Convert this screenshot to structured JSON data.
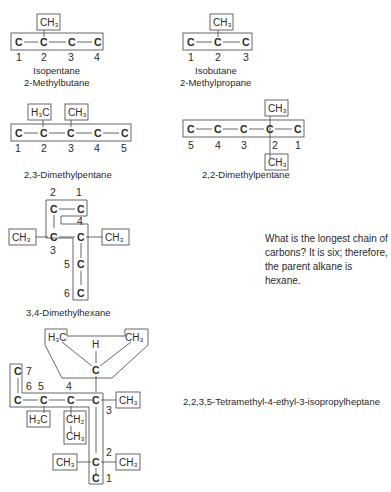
{
  "figure": {
    "isopentane": {
      "common_name": "Isopentane",
      "iupac_name": "2-Methylbutane",
      "atoms": [
        "C",
        "C",
        "C",
        "C"
      ],
      "numbers": [
        "1",
        "2",
        "3",
        "4"
      ],
      "substituent": "CH3"
    },
    "isobutane": {
      "common_name": "Isobutane",
      "iupac_name": "2-Methylpropane",
      "atoms": [
        "C",
        "C",
        "C"
      ],
      "numbers": [
        "1",
        "2",
        "3"
      ],
      "substituent": "CH3"
    },
    "dimethylpentane_23": {
      "iupac_name": "2,3-Dimethylpentane",
      "atoms": [
        "C",
        "C",
        "C",
        "C",
        "C"
      ],
      "numbers": [
        "1",
        "2",
        "3",
        "4",
        "5"
      ],
      "substituents": [
        "H3C",
        "CH3"
      ]
    },
    "dimethylpentane_22": {
      "iupac_name": "2,2-Dimethylpentane",
      "atoms": [
        "C",
        "C",
        "C",
        "C",
        "C"
      ],
      "numbers": [
        "5",
        "4",
        "3",
        "2",
        "1"
      ],
      "substituents": [
        "CH3",
        "CH3"
      ]
    },
    "dimethylhexane_34": {
      "iupac_name": "3,4-Dimethylhexane",
      "numbers": [
        "1",
        "2",
        "3",
        "4",
        "5",
        "6"
      ],
      "substituents": [
        "CH3",
        "CH3"
      ],
      "atom": "C"
    },
    "question_note": "What is the longest chain of carbons? It is six; therefore, the parent alkane is hexane.",
    "heptane": {
      "iupac_name": "2,2,3,5-Tetramethyl-4-ethyl-3-isopropylheptane",
      "numbers": [
        "1",
        "2",
        "3",
        "4",
        "5",
        "6",
        "7"
      ],
      "groups": {
        "h3c_left": "H3C",
        "ch3_right": "CH3",
        "h": "H",
        "ch3_c3": "CH3",
        "h3c_c5": "H3C",
        "ch2": "CH2",
        "ch3_ethyl": "CH3",
        "ch3_c2_left": "CH3",
        "ch3_c2_right": "CH3"
      },
      "atom": "C"
    }
  }
}
